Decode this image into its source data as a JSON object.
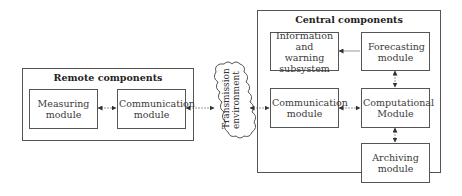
{
  "remote": {
    "title": "Remote components",
    "measuring": "Measuring module",
    "communication": "Communication module"
  },
  "transmission": {
    "line1": "Transmission",
    "line2": "environment"
  },
  "central": {
    "title": "Central components",
    "information": "Information and warning subsystem",
    "forecasting": "Forecasting module",
    "communication": "Communication module",
    "computational": "Computational Module",
    "archiving": "Archiving module"
  },
  "connections": [
    {
      "from": "Measuring module",
      "to": "Communication module (remote)",
      "type": "bidirectional"
    },
    {
      "from": "Communication module (remote)",
      "to": "Transmission environment",
      "type": "bidirectional"
    },
    {
      "from": "Transmission environment",
      "to": "Communication module (central)",
      "type": "bidirectional"
    },
    {
      "from": "Communication module (central)",
      "to": "Computational Module",
      "type": "bidirectional"
    },
    {
      "from": "Forecasting module",
      "to": "Information and warning subsystem",
      "type": "directed"
    },
    {
      "from": "Forecasting module",
      "to": "Computational Module",
      "type": "bidirectional"
    },
    {
      "from": "Computational Module",
      "to": "Archiving module",
      "type": "bidirectional"
    }
  ],
  "colors": {
    "line": "#555555",
    "connector": "#999999",
    "arrowhead": "#333333"
  }
}
